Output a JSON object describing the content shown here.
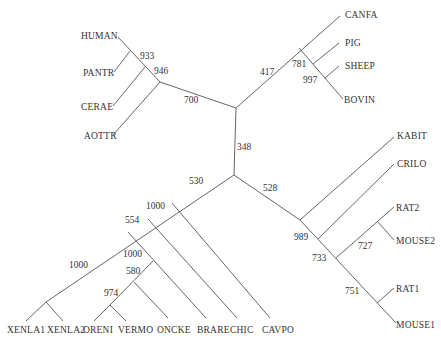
{
  "diagram": {
    "type": "unrooted-phylogenetic-tree",
    "leaves": {
      "human": "HUMAN",
      "pantr": "PANTR",
      "cerae": "CERAE",
      "aottr": "AOTTR",
      "canfa": "CANFA",
      "pig": "PIG",
      "sheep": "SHEEP",
      "bovin": "BOVIN",
      "kabit": "KABIT",
      "crilo": "CRILO",
      "rat2": "RAT2",
      "mouse2": "MOUSE2",
      "rat1": "RAT1",
      "mouse1": "MOUSE1",
      "xenla1": "XENLA1",
      "xenla2": "XENLA2",
      "oreni": "ORENI",
      "vermo": "VERMO",
      "oncke": "ONCKE",
      "brare": "BRARE",
      "chic": "CHIC",
      "cavpo": "CAVPO"
    },
    "bootstrap": {
      "b933": "933",
      "b946": "946",
      "b700": "700",
      "b417": "417",
      "b781": "781",
      "b997": "997",
      "b348": "348",
      "b528": "528",
      "b530": "530",
      "b989": "989",
      "b733": "733",
      "b727": "727",
      "b751": "751",
      "b1000a": "1000",
      "b554": "554",
      "b1000b": "1000",
      "b580": "580",
      "b974": "974",
      "b1000c": "1000"
    },
    "colors": {
      "line": "#555555",
      "text": "#333333",
      "background": "#ffffff"
    }
  }
}
